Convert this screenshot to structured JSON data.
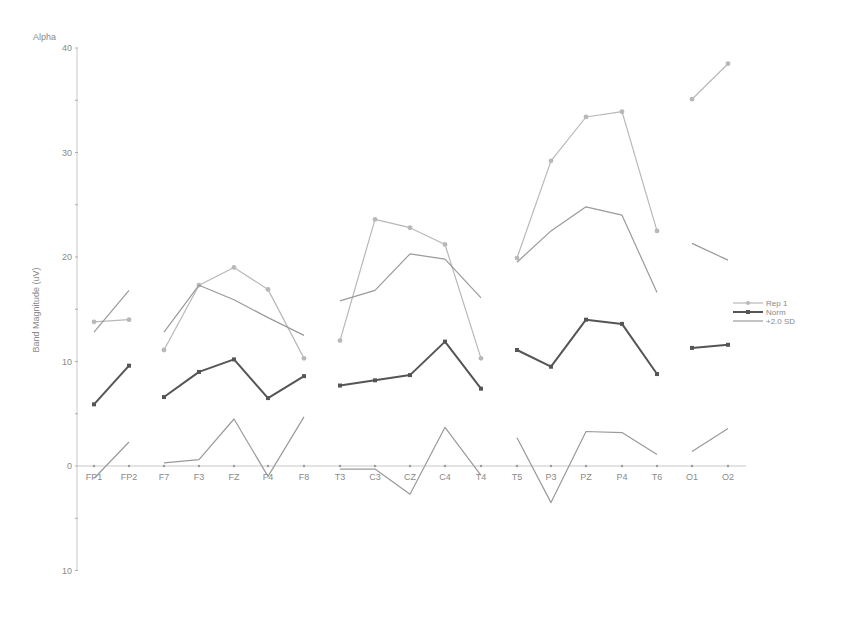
{
  "chart_data": {
    "type": "line",
    "title": "Alpha",
    "xlabel": "",
    "ylabel": "Band Magnitude (uV)",
    "ylim": [
      -10,
      40
    ],
    "yticks": [
      40,
      30,
      20,
      10,
      0,
      -10
    ],
    "ytick_labels": [
      "40",
      "30",
      "20",
      "10",
      "0",
      "10"
    ],
    "grid": false,
    "legend_position": "right",
    "categories": [
      "FP1",
      "FP2",
      "F7",
      "F3",
      "FZ",
      "F4",
      "F8",
      "T3",
      "C3",
      "CZ",
      "C4",
      "T4",
      "T5",
      "P3",
      "PZ",
      "P4",
      "T6",
      "O1",
      "O2"
    ],
    "groups": [
      [
        0,
        1
      ],
      [
        2,
        3,
        4,
        5,
        6
      ],
      [
        7,
        8,
        9,
        10,
        11
      ],
      [
        12,
        13,
        14,
        15,
        16
      ],
      [
        17,
        18
      ]
    ],
    "series": [
      {
        "name": "Rep 1",
        "color": "#b8b8b8",
        "width": 1.2,
        "marker": true,
        "values": [
          13.8,
          14.0,
          11.1,
          17.3,
          19.0,
          16.9,
          10.3,
          12.0,
          23.6,
          22.8,
          21.2,
          10.3,
          19.9,
          29.2,
          33.4,
          33.9,
          22.5,
          35.1,
          38.5
        ]
      },
      {
        "name": "Norm",
        "color": "#555555",
        "width": 2,
        "marker": true,
        "values": [
          5.9,
          9.6,
          6.6,
          9.0,
          10.2,
          6.5,
          8.6,
          7.7,
          8.2,
          8.7,
          11.9,
          7.4,
          11.1,
          9.5,
          14.0,
          13.6,
          8.8,
          11.3,
          11.6
        ]
      },
      {
        "name": "+2.0 SD",
        "color": "#9a9a9a",
        "width": 1.2,
        "marker": false,
        "values": [
          12.8,
          16.8,
          12.8,
          17.3,
          15.9,
          14.2,
          12.5,
          15.8,
          16.8,
          20.3,
          19.8,
          16.1,
          19.5,
          22.5,
          24.8,
          24.0,
          16.6,
          21.3,
          19.7
        ],
        "lower_values": [
          -1.2,
          2.3,
          0.3,
          0.6,
          4.5,
          -1.0,
          4.7,
          -0.3,
          -0.3,
          -2.7,
          3.7,
          -0.9,
          2.7,
          -3.5,
          3.3,
          3.2,
          1.1,
          1.4,
          3.6
        ]
      }
    ]
  },
  "legend": {
    "items": [
      {
        "label": "Rep 1"
      },
      {
        "label": "Norm"
      },
      {
        "label": "+2.0 SD"
      }
    ]
  }
}
